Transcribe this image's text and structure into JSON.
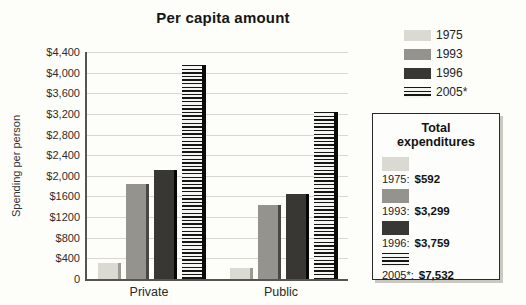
{
  "title": "Per capita amount",
  "y_axis": {
    "label": "Spending per person",
    "ticks": [
      "$4,400",
      "$4,000",
      "$3,600",
      "$3,200",
      "$2,800",
      "$2,400",
      "$2,000",
      "$1600",
      "$1200",
      "$800",
      "$400",
      "0"
    ]
  },
  "categories": [
    "Private",
    "Public"
  ],
  "legend_items": [
    {
      "label": "1975"
    },
    {
      "label": "1993"
    },
    {
      "label": "1996"
    },
    {
      "label": "2005*"
    }
  ],
  "series_colors": {
    "1975": {
      "fill": "#dadad3",
      "edge": "#9b9b93",
      "pattern": "solid"
    },
    "1993": {
      "fill": "#95938d",
      "edge": "#4a4843",
      "pattern": "solid"
    },
    "1996": {
      "fill": "#383733",
      "edge": "#060604",
      "pattern": "solid"
    },
    "2005*": {
      "fill": "#f5f5f1",
      "edge": "#0b0b09",
      "pattern": "striped"
    }
  },
  "grid_color": "#d8d8d1",
  "axis_color": "#55554f",
  "total_box": {
    "title": "Total expenditures",
    "entries": [
      {
        "swatch": "1975",
        "year_label": "1975:",
        "amount": "$592"
      },
      {
        "swatch": "1993",
        "year_label": "1993:",
        "amount": "$3,299"
      },
      {
        "swatch": "1996",
        "year_label": "1996:",
        "amount": "$3,759"
      },
      {
        "swatch": "2005*",
        "year_label": "2005*:",
        "amount": "$7,532"
      }
    ]
  },
  "chart_data": {
    "type": "bar",
    "title": "Per capita amount",
    "xlabel": "",
    "ylabel": "Spending per person",
    "categories": [
      "Private",
      "Public"
    ],
    "series": [
      {
        "name": "1975",
        "values": [
          320,
          210
        ]
      },
      {
        "name": "1993",
        "values": [
          1850,
          1430
        ]
      },
      {
        "name": "1996",
        "values": [
          2120,
          1650
        ]
      },
      {
        "name": "2005*",
        "values": [
          4150,
          3230
        ]
      }
    ],
    "ylim": [
      0,
      4400
    ],
    "ytick_step": 400,
    "grid": true,
    "legend_position": "top-right",
    "annotations": {
      "total_expenditures": {
        "1975": "$592",
        "1993": "$3,299",
        "1996": "$3,759",
        "2005*": "$7,532"
      }
    }
  }
}
